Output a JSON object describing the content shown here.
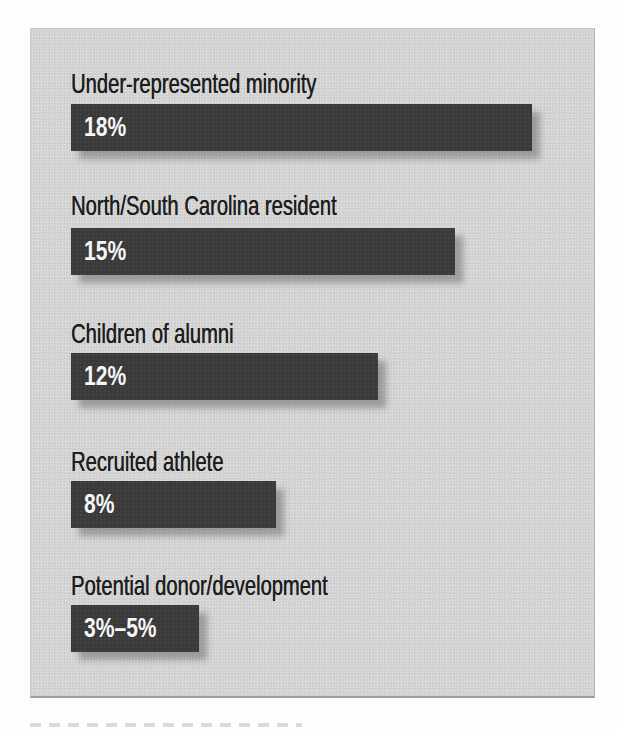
{
  "figure": {
    "background_color": "#fdfdfd",
    "panel_color": "#d2d2d2",
    "bar_color": "#3a3a3a",
    "category_label_color": "#1e1e1e",
    "value_label_color": "#f6f6f6"
  },
  "chart_data": {
    "type": "bar",
    "orientation": "horizontal",
    "title": "",
    "xlabel": "",
    "ylabel": "",
    "categories": [
      "Under-represented minority",
      "North/South Carolina resident",
      "Children of alumni",
      "Recruited athlete",
      "Potential donor/development"
    ],
    "values": [
      18,
      15,
      12,
      8,
      5
    ],
    "value_labels": [
      "18%",
      "15%",
      "12%",
      "8%",
      "3%–5%"
    ],
    "value_label_position": "inside-left",
    "xlim": [
      0,
      20
    ],
    "px_per_percent": 25.6,
    "grid": false,
    "legend": null,
    "axes_shown": false
  }
}
